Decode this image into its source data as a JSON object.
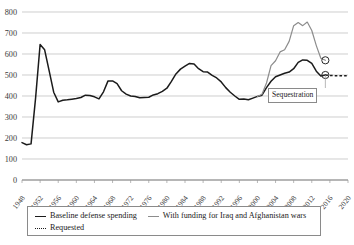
{
  "chart_data": {
    "type": "line",
    "title": "",
    "subtitle": "",
    "xlabel": "",
    "ylabel": "",
    "xlim": [
      1948,
      2020
    ],
    "ylim": [
      0,
      800
    ],
    "grid": true,
    "legend_position": "bottom",
    "y_ticks": [
      0,
      100,
      200,
      300,
      400,
      500,
      600,
      700,
      800
    ],
    "y_tick_labels": [
      "0",
      "100",
      "200",
      "300",
      "400",
      "500",
      "600",
      "700",
      "800"
    ],
    "x_ticks": [
      1948,
      1952,
      1956,
      1960,
      1964,
      1968,
      1972,
      1976,
      1980,
      1984,
      1988,
      1992,
      1996,
      2000,
      2004,
      2008,
      2012,
      2016,
      2020
    ],
    "x_tick_labels": [
      "1948",
      "1952",
      "1956",
      "1960",
      "1964",
      "1968",
      "1972",
      "1976",
      "1980",
      "1984",
      "1988",
      "1992",
      "1996",
      "2000",
      "2004",
      "2008",
      "2012",
      "2016",
      "2020"
    ],
    "series": [
      {
        "name": "Baseline defense spending",
        "color": "#1b1b1b",
        "style": "solid",
        "x": [
          1948,
          1949,
          1950,
          1951,
          1952,
          1953,
          1954,
          1955,
          1956,
          1957,
          1958,
          1959,
          1960,
          1961,
          1962,
          1963,
          1964,
          1965,
          1966,
          1967,
          1968,
          1969,
          1970,
          1971,
          1972,
          1973,
          1974,
          1975,
          1976,
          1977,
          1978,
          1979,
          1980,
          1981,
          1982,
          1983,
          1984,
          1985,
          1986,
          1987,
          1988,
          1989,
          1990,
          1991,
          1992,
          1993,
          1994,
          1995,
          1996,
          1997,
          1998,
          1999,
          2000,
          2001,
          2002,
          2003,
          2004,
          2005,
          2006,
          2007,
          2008,
          2009,
          2010,
          2011,
          2012,
          2013,
          2014,
          2015
        ],
        "y": [
          178,
          168,
          172,
          390,
          645,
          620,
          520,
          418,
          372,
          380,
          382,
          385,
          388,
          393,
          404,
          402,
          396,
          386,
          420,
          472,
          472,
          459,
          425,
          409,
          400,
          398,
          392,
          393,
          394,
          405,
          411,
          422,
          437,
          470,
          505,
          528,
          542,
          555,
          552,
          530,
          516,
          514,
          498,
          486,
          467,
          440,
          418,
          400,
          384,
          386,
          382,
          390,
          398,
          404,
          440,
          470,
          492,
          500,
          508,
          514,
          530,
          560,
          572,
          570,
          555,
          518,
          495,
          500
        ]
      },
      {
        "name": "With funding for Iraq and Afghanistan wars",
        "color": "#8c8c8c",
        "style": "solid",
        "x": [
          2000,
          2001,
          2002,
          2003,
          2004,
          2005,
          2006,
          2007,
          2008,
          2009,
          2010,
          2011,
          2012,
          2013,
          2014,
          2015
        ],
        "y": [
          398,
          408,
          462,
          545,
          568,
          610,
          620,
          660,
          735,
          750,
          735,
          752,
          712,
          640,
          580,
          570
        ]
      },
      {
        "name": "Requested",
        "color": "#1b1b1b",
        "style": "dotted",
        "x": [
          2015,
          2016,
          2017,
          2018,
          2019,
          2020
        ],
        "y": [
          500,
          498,
          497,
          497,
          496,
          496
        ]
      }
    ],
    "markers": [
      {
        "name": "war-funding-marker",
        "x": 2015,
        "y": 570
      },
      {
        "name": "baseline-marker",
        "x": 2015,
        "y": 500
      }
    ],
    "annotations": [
      {
        "name": "sequestration-callout",
        "text": "Sequestration"
      }
    ]
  },
  "legend": {
    "items": [
      {
        "label": "Baseline defense spending",
        "swatch": "solid-dark-line"
      },
      {
        "label": "With funding for Iraq and Afghanistan wars",
        "swatch": "solid-gray-line"
      },
      {
        "label": "Requested",
        "swatch": "dotted-dark-line"
      }
    ]
  }
}
